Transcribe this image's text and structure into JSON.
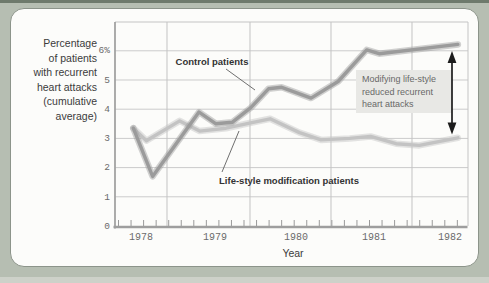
{
  "y_axis": {
    "label_lines": [
      "Percentage",
      "of patients",
      "with recurrent",
      "heart attacks",
      "(cumulative",
      "average)"
    ],
    "ticks": [
      {
        "label": "6%",
        "value": 6
      },
      {
        "label": "5",
        "value": 5
      },
      {
        "label": "4",
        "value": 4
      },
      {
        "label": "3",
        "value": 3
      },
      {
        "label": "2",
        "value": 2
      },
      {
        "label": "1",
        "value": 1
      },
      {
        "label": "0",
        "value": 0
      }
    ]
  },
  "x_axis": {
    "label": "Year",
    "ticks": [
      {
        "label": "1978"
      },
      {
        "label": "1979"
      },
      {
        "label": "1980"
      },
      {
        "label": "1981"
      },
      {
        "label": "1982"
      }
    ]
  },
  "annotation": {
    "lines": [
      "Modifying life-style",
      "reduced recurrent",
      "heart attacks"
    ],
    "box_color": "#e8e8e5",
    "arrow_color": "#1c1c1c"
  },
  "colors": {
    "frame_background": "#b6beb2",
    "panel_background": "#fcfcfa",
    "grid": "#cbcbcb",
    "axis": "#9e9e9e",
    "control_line": "#9b9b9b",
    "lifestyle_line": "#c3c3c3"
  },
  "chart_data": {
    "type": "line",
    "title": "",
    "xlabel": "Year",
    "ylabel": "Percentage of patients with recurrent heart attacks (cumulative average)",
    "xlim": [
      1977.75,
      1982.25
    ],
    "ylim": [
      0,
      7
    ],
    "x_tick_values": [
      1978,
      1979,
      1980,
      1981,
      1982
    ],
    "y_tick_values": [
      0,
      1,
      2,
      3,
      4,
      5,
      6
    ],
    "grid": true,
    "legend_position": "inline-labels",
    "series": [
      {
        "name": "Control patients",
        "color": "#9b9b9b",
        "points": [
          [
            1977.9,
            3.35
          ],
          [
            1978.15,
            1.7
          ],
          [
            1978.75,
            3.9
          ],
          [
            1978.97,
            3.5
          ],
          [
            1979.18,
            3.55
          ],
          [
            1979.42,
            4.05
          ],
          [
            1979.65,
            4.7
          ],
          [
            1979.82,
            4.75
          ],
          [
            1980.2,
            4.38
          ],
          [
            1980.55,
            4.95
          ],
          [
            1980.92,
            6.03
          ],
          [
            1981.08,
            5.9
          ],
          [
            1982.1,
            6.22
          ]
        ]
      },
      {
        "name": "Life-style modification patients",
        "color": "#c3c3c3",
        "points": [
          [
            1977.9,
            3.35
          ],
          [
            1978.07,
            2.92
          ],
          [
            1978.5,
            3.6
          ],
          [
            1978.76,
            3.25
          ],
          [
            1979.1,
            3.35
          ],
          [
            1979.45,
            3.55
          ],
          [
            1979.67,
            3.67
          ],
          [
            1980.05,
            3.2
          ],
          [
            1980.33,
            2.95
          ],
          [
            1980.7,
            3.0
          ],
          [
            1980.97,
            3.07
          ],
          [
            1981.3,
            2.82
          ],
          [
            1981.6,
            2.76
          ],
          [
            1982.1,
            3.02
          ]
        ]
      }
    ],
    "annotation": {
      "text": "Modifying life-style reduced recurrent heart attacks",
      "arrow_span_percent": [
        3.0,
        6.2
      ],
      "arrow_x_year": 1982.02
    }
  }
}
